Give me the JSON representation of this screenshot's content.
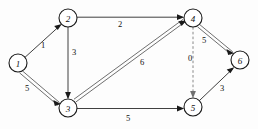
{
  "diagram": {
    "type": "directed-weighted-graph",
    "background_color": "#fdfdfd",
    "stroke_color": "#1a1a1a",
    "dashed_stroke_color": "#7a7a7a",
    "nodes": [
      {
        "id": "1",
        "label": "1",
        "x": 18,
        "y": 63,
        "r": 9
      },
      {
        "id": "2",
        "label": "2",
        "x": 68,
        "y": 18,
        "r": 9
      },
      {
        "id": "3",
        "label": "3",
        "x": 68,
        "y": 108,
        "r": 9
      },
      {
        "id": "4",
        "label": "4",
        "x": 193,
        "y": 18,
        "r": 9
      },
      {
        "id": "5",
        "label": "5",
        "x": 193,
        "y": 107,
        "r": 9
      },
      {
        "id": "6",
        "label": "6",
        "x": 240,
        "y": 60,
        "r": 9
      }
    ],
    "edges": [
      {
        "from": "1",
        "to": "2",
        "weight": "1",
        "style": "single",
        "label_x": 43,
        "label_y": 45
      },
      {
        "from": "1",
        "to": "3",
        "weight": "5",
        "style": "double",
        "label_x": 27,
        "label_y": 88
      },
      {
        "from": "2",
        "to": "3",
        "weight": "3",
        "style": "single",
        "label_x": 74,
        "label_y": 52
      },
      {
        "from": "2",
        "to": "4",
        "weight": "2",
        "style": "single",
        "label_x": 120,
        "label_y": 24
      },
      {
        "from": "3",
        "to": "4",
        "weight": "6",
        "style": "double",
        "label_x": 142,
        "label_y": 62
      },
      {
        "from": "3",
        "to": "5",
        "weight": "5",
        "style": "single",
        "label_x": 128,
        "label_y": 118
      },
      {
        "from": "4",
        "to": "5",
        "weight": "0",
        "style": "dashed",
        "label_x": 190,
        "label_y": 58
      },
      {
        "from": "4",
        "to": "6",
        "weight": "5",
        "style": "double",
        "label_x": 204,
        "label_y": 40
      },
      {
        "from": "5",
        "to": "6",
        "weight": "3",
        "style": "single",
        "label_x": 222,
        "label_y": 88
      }
    ]
  }
}
